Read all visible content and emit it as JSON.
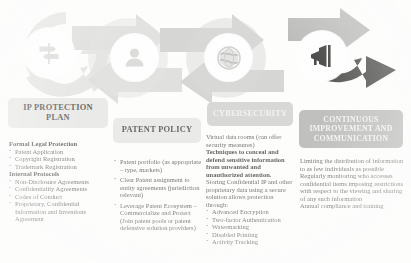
{
  "graphic": {
    "stages": [
      {
        "icon": "signpost-icon",
        "label": "stage-1-signpost"
      },
      {
        "icon": "user-icon",
        "label": "stage-2-user"
      },
      {
        "icon": "globe-icon",
        "label": "stage-3-globe"
      },
      {
        "icon": "megaphone-icon",
        "label": "stage-4-megaphone"
      }
    ],
    "arrow_colors": [
      "#e3e3e1",
      "#dcdcda",
      "#cfcfcd",
      "#4a4a48"
    ]
  },
  "columns": [
    {
      "id": "ip-protection-plan",
      "title": "IP PROTECTION\nPLAN",
      "title_line1": "IP PROTECTION",
      "title_line2": "PLAN",
      "pill_style": "light",
      "groups": [
        {
          "heading": "Formal Legal Protection",
          "items": [
            "Patent Application",
            "Copyright Registration",
            "Trademark Registration"
          ]
        },
        {
          "heading": "Internal Protocols",
          "items": [
            "Non-Disclosure Agreements",
            "Confidentiality Agreements",
            "Codes of Conduct",
            "Proprietary, Confidential Information and Inventions Agreement"
          ]
        }
      ]
    },
    {
      "id": "patent-policy",
      "title": "PATENT POLICY",
      "title_line1": "PATENT POLICY",
      "title_line2": "",
      "pill_style": "light",
      "bullets": [
        "Patent portfolio (as appropriate – type, markets)",
        "Clear Patent assignment to entity agreements (jurisdiction relevant)",
        "Leverage Patent Ecosystem – Commercialize and Protect (Join patent pools or patent defensive solution providers)"
      ]
    },
    {
      "id": "cybersecurity",
      "title": "CYBERSECURITY",
      "title_line1": "CYBERSECURITY",
      "title_line2": "",
      "pill_style": "mid",
      "paragraphs": [
        "Virtual data rooms (can offer security measures)",
        "Techniques to conceal and defend sensitive information from unwanted and unauthorized attention.",
        "Storing Confidential IP and other proprietary data using a secure solution allows protection through:"
      ],
      "bullets": [
        "Advanced Encryption",
        "Two-factor Authentication",
        "Watermarking",
        "Disabled Printing",
        "Activity Tracking"
      ]
    },
    {
      "id": "continuous-improvement-and-communication",
      "title": "CONTINUOUS IMPROVEMENT AND COMMUNICATION",
      "title_line1": "CONTINUOUS",
      "title_line2": "IMPROVEMENT AND",
      "title_line3": "COMMUNICATION",
      "pill_style": "dark",
      "paragraphs": [
        "Limiting the distribution of information to as few individuals as possible",
        "Regularly monitoring who accesses confidential items imposing restrictions with respect to the viewing and sharing of any such information",
        "Annual compliance and training"
      ]
    }
  ]
}
